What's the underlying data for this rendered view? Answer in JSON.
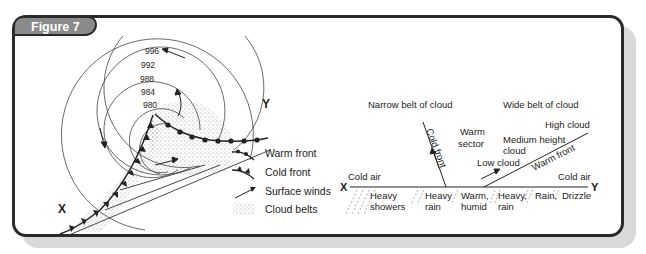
{
  "figure": {
    "tab_label": "Figure 7"
  },
  "map": {
    "isobars": [
      "996",
      "992",
      "988",
      "984",
      "980"
    ],
    "point_x": "X",
    "point_y": "Y"
  },
  "legend": {
    "items": [
      {
        "icon": "warm-front-icon",
        "label": "Warm front"
      },
      {
        "icon": "cold-front-icon",
        "label": "Cold front"
      },
      {
        "icon": "surface-winds-icon",
        "label": "Surface winds"
      },
      {
        "icon": "cloud-belts-icon",
        "label": "Cloud belts"
      }
    ]
  },
  "cross_section": {
    "narrow_belt": "Narrow belt of cloud",
    "wide_belt": "Wide belt of cloud",
    "cold_front": "Cold front",
    "warm_front": "Warm front",
    "warm_sector_1": "Warm",
    "warm_sector_2": "sector",
    "high_cloud": "High cloud",
    "medium_cloud_1": "Medium height",
    "medium_cloud_2": "cloud",
    "low_cloud": "Low cloud",
    "cold_air_left": "Cold air",
    "cold_air_right": "Cold air",
    "point_x": "X",
    "point_y": "Y",
    "weather": [
      {
        "l1": "Heavy",
        "l2": "showers"
      },
      {
        "l1": "Heavy",
        "l2": "rain"
      },
      {
        "l1": "Warm,",
        "l2": "humid"
      },
      {
        "l1": "Heavy,",
        "l2": "rain"
      },
      {
        "l1": "Rain,",
        "l2": ""
      },
      {
        "l1": "Drizzle",
        "l2": ""
      }
    ]
  }
}
